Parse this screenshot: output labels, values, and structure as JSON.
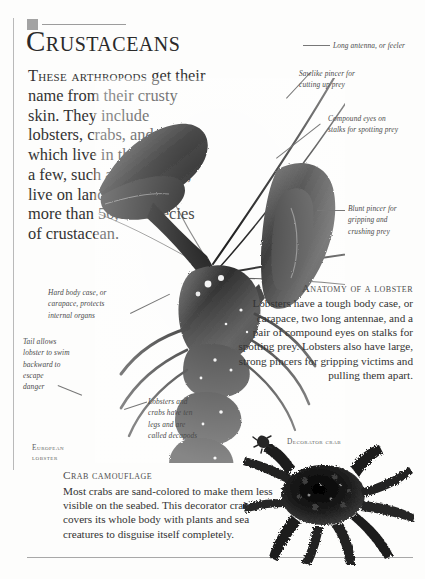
{
  "page": {
    "title": "Crustaceans",
    "headline": "Crustaceans"
  },
  "intro": {
    "lead": "These arthropods",
    "body": " get their name from their crusty skin. They include lobsters, crabs, and shrimp, which live in the sea. Only a few, such as wood lice, live on land. There are more than 50,000 species of crustacean."
  },
  "annotations": [
    {
      "id": "long-antenna",
      "text": "Long antenna, or feeler"
    },
    {
      "id": "sawlike-pincer",
      "text": "Sawlike pincer for\ncutting up prey"
    },
    {
      "id": "compound-eyes",
      "text": "Compound eyes on\nstalks for spotting prey"
    },
    {
      "id": "blunt-pincer",
      "text": "Blunt pincer for\ngripping and\ncrushing prey"
    },
    {
      "id": "hard-body-case",
      "text": "Hard body case, or\ncarapace, protects\ninternal organs"
    },
    {
      "id": "tail",
      "text": "Tail allows\nlobster to swim\nbackward to\nescape\ndanger"
    },
    {
      "id": "decapods",
      "text": "Lobsters and\ncrabs have ten\nlegs and are\ncalled decapods"
    }
  ],
  "anatomy": {
    "heading": "Anatomy of a lobster",
    "body": "Lobsters have a tough body case, or carapace, two long antennae, and a pair of compound eyes on stalks for spotting prey. Lobsters also have large, strong pincers for gripping victims and pulling them apart."
  },
  "camouflage": {
    "heading": "Crab camouflage",
    "body": "Most crabs are sand-colored to make them less visible on the seabed. This decorator crab covers its whole body with plants and sea creatures to disguise itself completely."
  },
  "captions": {
    "european_lobster": "European\nlobster",
    "decorator_crab": "Decorator crab"
  },
  "colors": {
    "text": "#333333",
    "rule": "#a8a8a8",
    "square": "#a3a3a3",
    "annotation": "#4a4a4a",
    "caption": "#5e5e5e",
    "background": "#fdfdfc"
  }
}
